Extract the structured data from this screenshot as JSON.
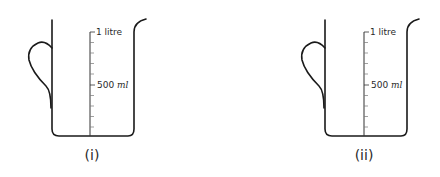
{
  "figure": {
    "beakers": [
      {
        "id": "i",
        "caption": "(i)",
        "scale_top_label": "1 litre",
        "scale_mid_value": "500",
        "scale_mid_unit": "ml",
        "ox": 0
      },
      {
        "id": "ii",
        "caption": "(ii)",
        "scale_top_label": "1 litre",
        "scale_mid_value": "500",
        "scale_mid_unit": "ml",
        "ox": 273
      }
    ],
    "colors": {
      "line": "#1a1a1a",
      "text": "#2a2a2a",
      "background": "#ffffff"
    }
  }
}
